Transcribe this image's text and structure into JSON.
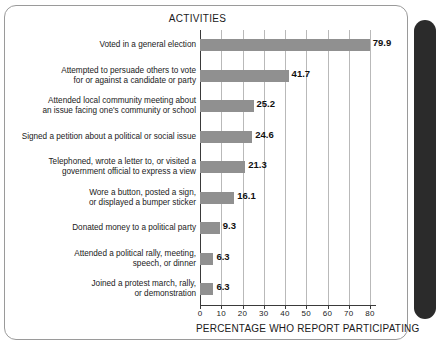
{
  "figure": {
    "title": "ACTIVITIES",
    "xaxis_title": "PERCENTAGE WHO REPORT PARTICIPATING",
    "bar_color": "#909090",
    "grid_color": "#b9b9b9",
    "axis_color": "#3a3a3a",
    "frame_color": "#9a9a9a",
    "spine_color": "#2b2b2b"
  },
  "chart_data": {
    "type": "bar",
    "orientation": "horizontal",
    "title": "ACTIVITIES",
    "xlabel": "PERCENTAGE WHO REPORT PARTICIPATING",
    "ylabel": "",
    "xlim": [
      0,
      80
    ],
    "xticks": [
      0,
      10,
      20,
      30,
      40,
      50,
      60,
      70,
      80
    ],
    "xtick_labels": [
      "0",
      "10",
      "20",
      "30",
      "40",
      "50",
      "60",
      "70",
      "80"
    ],
    "grid": true,
    "grid_axis": "x",
    "legend": "none",
    "value_labels": true,
    "categories": [
      "Voted in a general election",
      "Attempted to persuade others to vote\nfor or against a candidate or party",
      "Attended local community meeting about\nan issue facing one's community or school",
      "Signed a petition about a political or social issue",
      "Telephoned, wrote a letter to, or visited a\ngovernment official to express a view",
      "Wore a button, posted a sign,\nor displayed a bumper sticker",
      "Donated money to a political party",
      "Attended a political rally, meeting,\nspeech, or dinner",
      "Joined a protest march, rally,\nor demonstration"
    ],
    "values": [
      79.9,
      41.7,
      25.2,
      24.6,
      21.3,
      16.1,
      9.3,
      6.3,
      6.3
    ],
    "value_label_text": [
      "79.9",
      "41.7",
      "25.2",
      "24.6",
      "21.3",
      "16.1",
      "9.3",
      "6.3",
      "6.3"
    ]
  }
}
